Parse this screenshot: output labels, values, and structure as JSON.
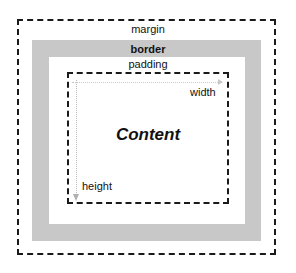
{
  "diagram": {
    "layers": {
      "margin": {
        "label": "margin",
        "style": "dashed outline"
      },
      "border": {
        "label": "border",
        "style": "gray band",
        "color": "#c8c8c8"
      },
      "padding": {
        "label": "padding",
        "style": "white area"
      },
      "content": {
        "label": "Content",
        "style": "dashed outline"
      }
    },
    "dimensions": {
      "width": {
        "label": "width",
        "arrow": "horizontal dotted arrow across top of content"
      },
      "height": {
        "label": "height",
        "arrow": "vertical dotted arrow down left of content"
      }
    },
    "colors": {
      "line": "#1a1a1a",
      "border_band": "#c8c8c8",
      "arrow": "#c0c0c0",
      "background": "#ffffff"
    }
  }
}
